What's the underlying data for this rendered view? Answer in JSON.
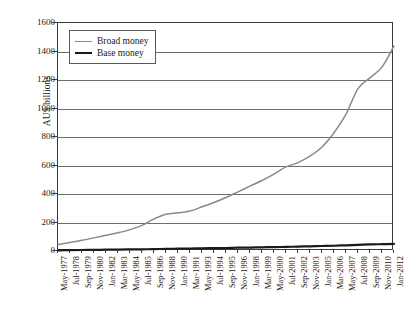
{
  "chart_data": {
    "type": "line",
    "title": "",
    "xlabel": "",
    "ylabel": "AU$ billions",
    "ylim": [
      0,
      1600
    ],
    "yticks": [
      0,
      200,
      400,
      600,
      800,
      1000,
      1200,
      1400,
      1600
    ],
    "grid": true,
    "legend_position": "upper-left",
    "categories": [
      "May-1977",
      "Jul-1978",
      "Sep-1979",
      "Nov-1980",
      "Jan-1982",
      "Mar-1983",
      "May-1984",
      "Jul-1985",
      "Sep-1986",
      "Nov-1988",
      "Jan-1990",
      "Mar-1991",
      "May-1993",
      "Jul-1994",
      "Sep-1995",
      "Nov-1996",
      "Jan-1998",
      "Mar-1999",
      "May-2000",
      "Jul-2001",
      "Sep-2002",
      "Nov-2003",
      "Jan-2005",
      "Mar-2006",
      "May-2007",
      "Jul-2008",
      "Sep-2009",
      "Nov-2010",
      "Jan-2012"
    ],
    "series": [
      {
        "name": "Broad money",
        "color": "#8a8a8a",
        "values": [
          45,
          60,
          75,
          92,
          110,
          128,
          150,
          180,
          225,
          258,
          268,
          280,
          310,
          340,
          375,
          415,
          455,
          495,
          540,
          590,
          620,
          665,
          730,
          830,
          960,
          1140,
          1215,
          1290,
          1440
        ]
      },
      {
        "name": "Base money",
        "color": "#1a1a1a",
        "values": [
          5,
          6,
          7,
          8,
          9,
          10,
          11,
          12,
          13,
          15,
          16,
          17,
          19,
          20,
          21,
          23,
          24,
          26,
          27,
          29,
          31,
          33,
          35,
          37,
          40,
          43,
          46,
          48,
          50
        ]
      }
    ]
  },
  "legend": {
    "items": [
      {
        "label": "Broad money"
      },
      {
        "label": "Base money"
      }
    ]
  }
}
